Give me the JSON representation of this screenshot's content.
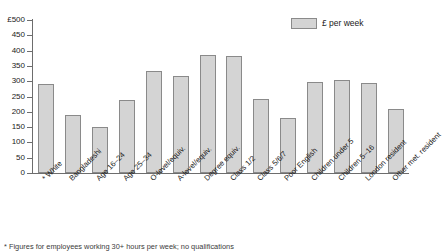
{
  "chart_data": {
    "type": "bar",
    "title": "",
    "xlabel": "",
    "ylabel": "",
    "ylim": [
      0,
      500
    ],
    "ytick_step": 50,
    "grid": false,
    "legend_position": "top-right",
    "currency_prefix": "£",
    "categories": [
      "* White",
      "Bangladeshi",
      "Age 16–24",
      "Age 25–34",
      "O-level/equiv.",
      "A-level/equiv.",
      "Degree equiv.",
      "Class 1/2",
      "Class 5/6/7",
      "Poor English",
      "Children under 5",
      "Children 5–16",
      "London resident",
      "Other met. resident"
    ],
    "series": [
      {
        "name": "£ per week",
        "values": [
          290,
          188,
          152,
          238,
          335,
          318,
          387,
          382,
          242,
          181,
          299,
          304,
          293,
          210
        ]
      }
    ],
    "ytick_labels": [
      "£500",
      "450",
      "400",
      "350",
      "300",
      "250",
      "200",
      "150",
      "100",
      "50",
      "0"
    ],
    "ytick_values": [
      500,
      450,
      400,
      350,
      300,
      250,
      200,
      150,
      100,
      50,
      0
    ]
  },
  "legend": {
    "entries": [
      {
        "label": "£ per week",
        "color": "#d4d4d4"
      }
    ]
  },
  "footnote": {
    "text": "* Figures for employees working 30+ hours per week; no qualifications"
  },
  "colors": {
    "bar_fill": "#d4d4d4",
    "bar_border": "#8a8a8a",
    "axis": "#6d6d6d",
    "text": "#1a1a1a"
  }
}
